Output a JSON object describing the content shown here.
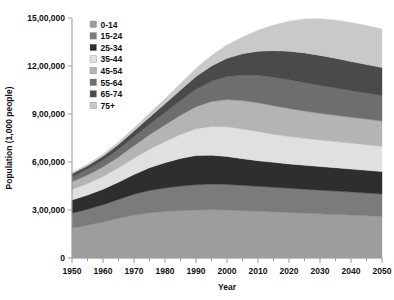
{
  "chart_data": {
    "type": "area",
    "stacked": true,
    "title": "",
    "xlabel": "Year",
    "ylabel": "Population (1,000 people)",
    "xlim": [
      1950,
      2050
    ],
    "ylim": [
      0,
      1500000
    ],
    "grid": false,
    "legend_position": "top-left-inside",
    "x_tick_labels": [
      "1950",
      "1960",
      "1970",
      "1980",
      "1990",
      "2000",
      "2010",
      "2020",
      "2030",
      "2040",
      "2050"
    ],
    "x_major_ticks": [
      1950,
      1960,
      1970,
      1980,
      1990,
      2000,
      2010,
      2020,
      2030,
      2040,
      2050
    ],
    "x_minor_ticks": [
      1955,
      1965,
      1975,
      1985,
      1995,
      2005,
      2015,
      2025,
      2035,
      2045
    ],
    "y_tick_labels": [
      "0",
      "3,00,000",
      "6,00,000",
      "9,00,000",
      "12,00,000",
      "15,00,000"
    ],
    "y_major_ticks": [
      0,
      300000,
      600000,
      900000,
      1200000,
      1500000
    ],
    "x": [
      1950,
      1955,
      1960,
      1965,
      1970,
      1975,
      1980,
      1985,
      1990,
      1995,
      2000,
      2005,
      2010,
      2015,
      2020,
      2025,
      2030,
      2035,
      2040,
      2045,
      2050
    ],
    "series": [
      {
        "name": "0-14",
        "color": "#9d9d9d",
        "values": [
          186000,
          205000,
          225000,
          248000,
          268000,
          282000,
          290000,
          296000,
          300000,
          302000,
          300000,
          296000,
          292000,
          288000,
          284000,
          280000,
          276000,
          272000,
          268000,
          264000,
          260000
        ]
      },
      {
        "name": "15-24",
        "color": "#7b7b7b",
        "values": [
          94000,
          100000,
          108000,
          118000,
          130000,
          140000,
          148000,
          154000,
          158000,
          160000,
          160000,
          158000,
          156000,
          154000,
          152000,
          150000,
          148000,
          146000,
          144000,
          142000,
          140000
        ]
      },
      {
        "name": "25-34",
        "color": "#2e2e2e",
        "values": [
          82000,
          88000,
          96000,
          108000,
          124000,
          142000,
          158000,
          172000,
          182000,
          180000,
          174000,
          166000,
          160000,
          156000,
          152000,
          150000,
          148000,
          146000,
          144000,
          142000,
          140000
        ]
      },
      {
        "name": "35-44",
        "color": "#e0e0e0",
        "values": [
          66000,
          72000,
          80000,
          90000,
          102000,
          116000,
          132000,
          150000,
          168000,
          180000,
          186000,
          186000,
          182000,
          176000,
          172000,
          168000,
          166000,
          164000,
          162000,
          160000,
          158000
        ]
      },
      {
        "name": "45-54",
        "color": "#b4b4b4",
        "values": [
          48000,
          54000,
          60000,
          68000,
          78000,
          90000,
          104000,
          120000,
          138000,
          156000,
          170000,
          178000,
          180000,
          178000,
          174000,
          170000,
          166000,
          164000,
          162000,
          160000,
          158000
        ]
      },
      {
        "name": "55-64",
        "color": "#6e6e6e",
        "values": [
          32000,
          36000,
          42000,
          48000,
          56000,
          66000,
          78000,
          92000,
          108000,
          126000,
          144000,
          160000,
          172000,
          178000,
          180000,
          178000,
          174000,
          170000,
          166000,
          163000,
          160000
        ]
      },
      {
        "name": "65-74",
        "color": "#4a4a4a",
        "values": [
          18000,
          21000,
          25000,
          30000,
          36000,
          44000,
          54000,
          66000,
          80000,
          96000,
          114000,
          132000,
          150000,
          166000,
          178000,
          186000,
          188000,
          186000,
          182000,
          178000,
          174000
        ]
      },
      {
        "name": "75+",
        "color": "#c9c9c9",
        "values": [
          8000,
          10000,
          12000,
          15000,
          19000,
          24000,
          31000,
          40000,
          52000,
          66000,
          84000,
          106000,
          132000,
          160000,
          188000,
          212000,
          230000,
          240000,
          244000,
          244000,
          242000
        ]
      }
    ]
  }
}
